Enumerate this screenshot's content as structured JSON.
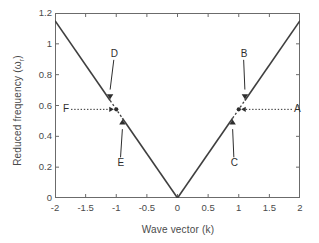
{
  "chart_data": {
    "type": "line",
    "title": "",
    "xlabel": "Wave vector (k)",
    "ylabel_main": "Reduced  frequency (",
    "ylabel_symbol": "ω",
    "ylabel_sub": "r",
    "ylabel_close": ")",
    "ylabel_full": "Reduced  frequency (ωr)",
    "xlim": [
      -2,
      2
    ],
    "ylim": [
      0,
      1.2
    ],
    "grid": false,
    "legend": "none",
    "xticks": [
      "-2",
      "-1.5",
      "-1",
      "-0.5",
      "0",
      "0.5",
      "1",
      "1.5",
      "2"
    ],
    "xtick_values": [
      -2,
      -1.5,
      -1,
      -0.5,
      0,
      0.5,
      1,
      1.5,
      2
    ],
    "yticks": [
      "0",
      "0.2",
      "0.4",
      "0.6",
      "0.8",
      "1",
      "1.2"
    ],
    "ytick_values": [
      0,
      0.2,
      0.4,
      0.6,
      0.8,
      1,
      1.2
    ],
    "series": [
      {
        "name": "dispersion",
        "style": "solid-with-dashed-gaps",
        "x": [
          -2,
          -1.5,
          -1.1,
          -1.0,
          -0.9,
          -0.5,
          0,
          0.5,
          0.9,
          1.0,
          1.1,
          1.5,
          2
        ],
        "values": [
          1.15,
          0.863,
          0.633,
          0.575,
          0.518,
          0.288,
          0.0,
          0.288,
          0.518,
          0.575,
          0.633,
          0.863,
          1.15
        ]
      }
    ],
    "markers": [
      {
        "label": "A",
        "type": "circle",
        "k": 1.0,
        "omega": 0.575,
        "arrow": "dotted-left",
        "text_x": 1.95,
        "text_y": 0.575
      },
      {
        "label": "B",
        "type": "down-triangle",
        "k": 1.1,
        "omega": 0.645,
        "arrow": "solid-down",
        "text_x": 1.08,
        "text_y": 0.935
      },
      {
        "label": "C",
        "type": "up-triangle",
        "k": 0.9,
        "omega": 0.505,
        "arrow": "solid-up",
        "text_x": 0.92,
        "text_y": 0.225
      },
      {
        "label": "D",
        "type": "down-triangle",
        "k": -1.1,
        "omega": 0.645,
        "arrow": "solid-down",
        "text_x": -1.04,
        "text_y": 0.935
      },
      {
        "label": "E",
        "type": "up-triangle",
        "k": -0.9,
        "omega": 0.505,
        "arrow": "solid-up",
        "text_x": -0.93,
        "text_y": 0.225
      },
      {
        "label": "F",
        "type": "circle",
        "k": -1.0,
        "omega": 0.575,
        "arrow": "dotted-right",
        "text_x": -1.82,
        "text_y": 0.575
      }
    ],
    "colors": {
      "curve": "#3f3f3f",
      "axis": "#6b6b6b",
      "text": "#4a4a4a",
      "annotation": "#2e2e2e",
      "background": "#ffffff"
    }
  }
}
